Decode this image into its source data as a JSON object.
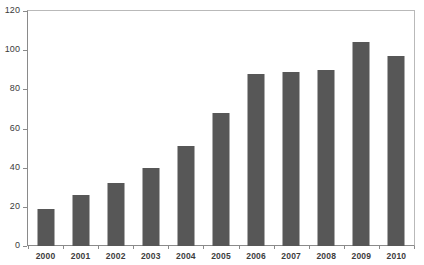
{
  "chart_data": {
    "type": "bar",
    "title": "",
    "subtitle": "",
    "xlabel": "",
    "ylabel": "",
    "categories": [
      "2000",
      "2001",
      "2002",
      "2003",
      "2004",
      "2005",
      "2006",
      "2007",
      "2008",
      "2009",
      "2010"
    ],
    "values": [
      19,
      26,
      32,
      40,
      51,
      68,
      88,
      89,
      90,
      104,
      97
    ],
    "ylim": [
      0,
      120
    ],
    "yticks": [
      0,
      20,
      40,
      60,
      80,
      100,
      120
    ],
    "ytick_labels": [
      "0",
      "20",
      "40",
      "60",
      "80",
      "100",
      "120"
    ],
    "grid": false,
    "legend": null,
    "legend_position": "none",
    "series": [
      {
        "name": "",
        "values": [
          19,
          26,
          32,
          40,
          51,
          68,
          88,
          89,
          90,
          104,
          97
        ]
      }
    ],
    "annotations": [],
    "colors": {
      "bar_fill": "#575757",
      "axis_line": "#8a8a8a",
      "frame_line": "#b9b9b9",
      "tick_label": "#3b3b3b",
      "category_label": "#3d3d3d",
      "background": "#ffffff"
    }
  }
}
